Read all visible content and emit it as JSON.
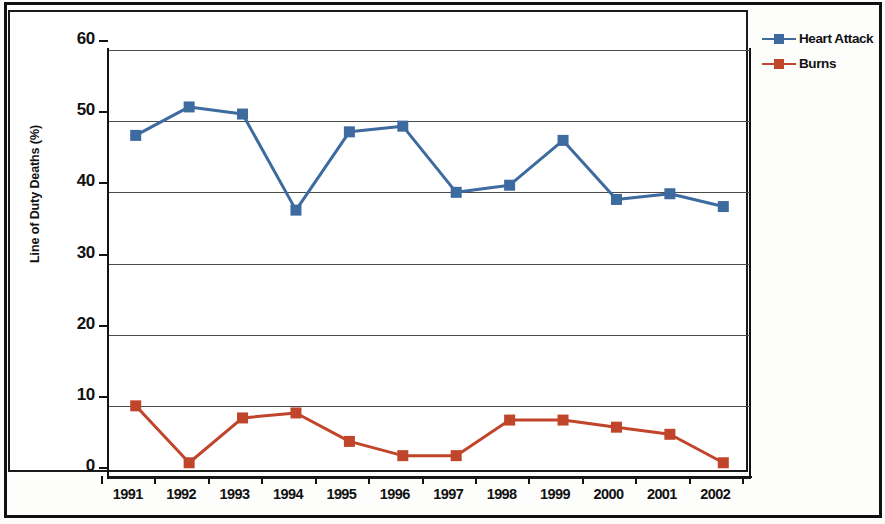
{
  "chart_data": {
    "type": "line",
    "title": "",
    "xlabel": "",
    "ylabel": "Line of Duty Deaths (%)",
    "categories": [
      "1991",
      "1992",
      "1993",
      "1994",
      "1995",
      "1996",
      "1997",
      "1998",
      "1999",
      "2000",
      "2001",
      "2002"
    ],
    "ylim": [
      0,
      60
    ],
    "ytick_labels": [
      "60",
      "50",
      "40",
      "30",
      "20",
      "10",
      "0"
    ],
    "ytick_values": [
      60,
      50,
      40,
      30,
      20,
      10,
      0
    ],
    "grid": true,
    "legend_position": "top-right-outside",
    "series": [
      {
        "name": "Heart Attack",
        "color": "#3d6a9f",
        "marker": "square",
        "values": [
          48,
          52,
          51,
          37.5,
          48.5,
          49.3,
          40,
          41,
          47.3,
          39,
          39.8,
          38
        ]
      },
      {
        "name": "Burns",
        "color": "#c0452a",
        "marker": "square",
        "values": [
          10,
          2,
          8.3,
          9,
          5,
          3,
          3,
          8,
          8,
          7,
          6,
          2
        ]
      }
    ]
  },
  "legend": {
    "items": [
      {
        "label": "Heart Attack",
        "color": "#3d6a9f"
      },
      {
        "label": "Burns",
        "color": "#c0452a"
      }
    ]
  }
}
